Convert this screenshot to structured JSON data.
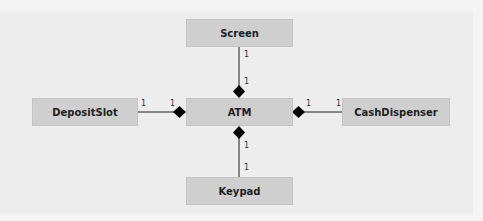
{
  "diagram": {
    "type": "UML class diagram (composition)",
    "classes": [
      {
        "id": "screen",
        "name": "Screen"
      },
      {
        "id": "atm",
        "name": "ATM"
      },
      {
        "id": "depositslot",
        "name": "DepositSlot"
      },
      {
        "id": "cashdispenser",
        "name": "CashDispenser"
      },
      {
        "id": "keypad",
        "name": "Keypad"
      }
    ],
    "relationships": [
      {
        "whole": "ATM",
        "part": "Screen",
        "kind": "composition",
        "whole_multiplicity": "1",
        "part_multiplicity": "1"
      },
      {
        "whole": "ATM",
        "part": "DepositSlot",
        "kind": "composition",
        "whole_multiplicity": "1",
        "part_multiplicity": "1"
      },
      {
        "whole": "ATM",
        "part": "CashDispenser",
        "kind": "composition",
        "whole_multiplicity": "1",
        "part_multiplicity": "1"
      },
      {
        "whole": "ATM",
        "part": "Keypad",
        "kind": "composition",
        "whole_multiplicity": "1",
        "part_multiplicity": "1"
      }
    ],
    "colors": {
      "box_fill": "#cfcfcf",
      "line": "#1e1e1e",
      "diamond": "#000000",
      "background": "#f4f4f4"
    }
  }
}
